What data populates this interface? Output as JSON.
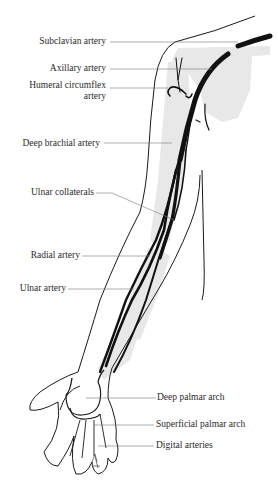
{
  "diagram": {
    "colors": {
      "artery": "#111111",
      "outline": "#1a1a1a",
      "bone_shade": "#e6e6e6",
      "leader": "#555555"
    },
    "labels_left": [
      {
        "id": "subclavian",
        "text": "Subclavian artery"
      },
      {
        "id": "axillary",
        "text": "Axillary artery"
      },
      {
        "id": "humeral_circumflex_1",
        "text": "Humeral circumflex"
      },
      {
        "id": "humeral_circumflex_2",
        "text": "artery"
      },
      {
        "id": "deep_brachial",
        "text": "Deep brachial artery"
      },
      {
        "id": "ulnar_collaterals",
        "text": "Ulnar collaterals"
      },
      {
        "id": "radial",
        "text": "Radial artery"
      },
      {
        "id": "ulnar",
        "text": "Ulnar artery"
      }
    ],
    "labels_right": [
      {
        "id": "deep_palmar",
        "text": "Deep palmar arch"
      },
      {
        "id": "superficial_palmar",
        "text": "Superficial palmar arch"
      },
      {
        "id": "digital",
        "text": "Digital arteries"
      }
    ]
  }
}
